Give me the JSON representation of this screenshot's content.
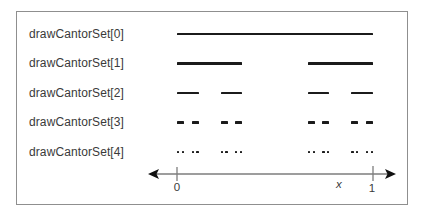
{
  "figure": {
    "rows": [
      {
        "label": "drawCantorSet[0]",
        "segments": [
          [
            0,
            1
          ]
        ]
      },
      {
        "label": "drawCantorSet[1]",
        "segments": [
          [
            0,
            0.333333
          ],
          [
            0.666667,
            1
          ]
        ]
      },
      {
        "label": "drawCantorSet[2]",
        "segments": [
          [
            0,
            0.111111
          ],
          [
            0.222222,
            0.333333
          ],
          [
            0.666667,
            0.777778
          ],
          [
            0.888889,
            1
          ]
        ]
      },
      {
        "label": "drawCantorSet[3]",
        "segments": [
          [
            0,
            0.037037
          ],
          [
            0.074074,
            0.111111
          ],
          [
            0.222222,
            0.259259
          ],
          [
            0.296296,
            0.333333
          ],
          [
            0.666667,
            0.703704
          ],
          [
            0.740741,
            0.777778
          ],
          [
            0.888889,
            0.925926
          ],
          [
            0.962963,
            1
          ]
        ]
      },
      {
        "label": "drawCantorSet[4]",
        "segments": [
          [
            0,
            0.012346
          ],
          [
            0.024691,
            0.037037
          ],
          [
            0.074074,
            0.08642
          ],
          [
            0.098765,
            0.111111
          ],
          [
            0.222222,
            0.234568
          ],
          [
            0.246914,
            0.259259
          ],
          [
            0.296296,
            0.308642
          ],
          [
            0.320988,
            0.333333
          ],
          [
            0.666667,
            0.679012
          ],
          [
            0.691358,
            0.703704
          ],
          [
            0.740741,
            0.753086
          ],
          [
            0.765432,
            0.777778
          ],
          [
            0.888889,
            0.901235
          ],
          [
            0.91358,
            0.925926
          ],
          [
            0.962963,
            0.975309
          ],
          [
            0.987654,
            1
          ]
        ]
      }
    ],
    "axis": {
      "min": 0,
      "max": 1,
      "tick_labels": [
        "0",
        "1"
      ],
      "variable": "x"
    }
  },
  "colors": {
    "segment": "#1b1b1b",
    "label_text": "#3a3a3a",
    "axis_line": "#7d7d7d",
    "arrowhead": "#111111",
    "frame_border": "#8f8f8f",
    "background": "#ffffff"
  }
}
